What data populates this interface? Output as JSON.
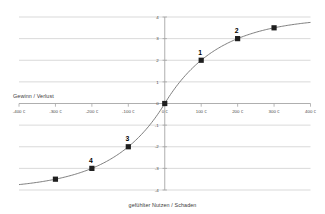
{
  "chart_data": {
    "type": "line",
    "title": "",
    "x_axis": {
      "label": "Gewinn / Verlust",
      "tick_labels": [
        "-400 €",
        "-300 €",
        "-200 €",
        "-100 €",
        "0 €",
        "100 €",
        "200 €",
        "300 €",
        "400 €"
      ],
      "tick_values": [
        -400,
        -300,
        -200,
        -100,
        0,
        100,
        200,
        300,
        400
      ],
      "range": [
        -400,
        400
      ]
    },
    "y_axis": {
      "label": "gefühlter Nutzen / Schaden",
      "tick_labels": [
        "4",
        "3",
        "2",
        "1",
        "0",
        "-1",
        "-2",
        "-3",
        "-4"
      ],
      "tick_values": [
        4,
        3,
        2,
        1,
        0,
        -1,
        -2,
        -3,
        -4
      ],
      "range": [
        -4,
        4
      ]
    },
    "grid": true,
    "legend": false,
    "series": [
      {
        "name": "value-function-curve",
        "formula": "v(x) = sign(x) · 4 · (1 − 2^(−|x|/100))",
        "amplitude": 4,
        "halving_x": 100,
        "points": [
          {
            "x": -300,
            "y": -3.5,
            "label": ""
          },
          {
            "x": -200,
            "y": -3.0,
            "label": "4"
          },
          {
            "x": -100,
            "y": -2.0,
            "label": "3"
          },
          {
            "x": 0,
            "y": 0.0,
            "label": ""
          },
          {
            "x": 100,
            "y": 2.0,
            "label": "1"
          },
          {
            "x": 200,
            "y": 3.0,
            "label": "2"
          },
          {
            "x": 300,
            "y": 3.5,
            "label": ""
          }
        ]
      }
    ],
    "colors": {
      "background": "#ffffff",
      "gridline": "#c9c9c9",
      "axis": "#a6a6a6",
      "curve": "#707070",
      "marker": "#1f1f1f",
      "tick_text": "#4a4a4a",
      "point_label_text": "#000000"
    }
  }
}
